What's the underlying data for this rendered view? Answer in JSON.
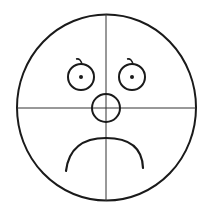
{
  "figure": {
    "stroke_color": "#1a1a1a",
    "guide_color": "#333333",
    "background": "#ffffff"
  },
  "shapes": {
    "head": {
      "cx": 106.5,
      "cy": 107.5,
      "rx": 89.5,
      "ry": 93
    },
    "vertical_guide": {
      "x": 106,
      "y1": 14,
      "y2": 201
    },
    "horizontal_guide": {
      "y": 108,
      "x1": 17,
      "x2": 196
    },
    "left_eye": {
      "cx": 81,
      "cy": 77,
      "r": 13,
      "pupil_r": 2
    },
    "right_eye": {
      "cx": 132,
      "cy": 77,
      "r": 13,
      "pupil_r": 2
    },
    "nose": {
      "cx": 106,
      "cy": 108,
      "rx": 14,
      "ry": 14
    },
    "mouth": {
      "path": "M 66 171 Q 70 138 106 138 Q 142 138 143 168"
    }
  }
}
